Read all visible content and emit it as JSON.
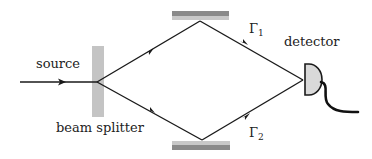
{
  "diagram": {
    "type": "Mach-Zehnder interferometer",
    "labels": {
      "source": "source",
      "beam_splitter": "beam splitter",
      "detector": "detector",
      "path1_symbol": "Γ",
      "path1_sub": "1",
      "path2_symbol": "Γ",
      "path2_sub": "2"
    },
    "colors": {
      "line": "#1a1a1a",
      "splitter": "#c4c4c4",
      "mirror_light": "#c8c8c8",
      "mirror_dark": "#8a8a8a",
      "detector_fill": "#d9d9d9"
    },
    "nodes": [
      {
        "id": "source",
        "label": "source"
      },
      {
        "id": "beam-splitter",
        "label": "beam splitter"
      },
      {
        "id": "mirror-top",
        "label": ""
      },
      {
        "id": "mirror-bottom",
        "label": ""
      },
      {
        "id": "detector",
        "label": "detector"
      }
    ],
    "edges": [
      {
        "from": "source",
        "to": "beam-splitter"
      },
      {
        "from": "beam-splitter",
        "to": "mirror-top"
      },
      {
        "from": "beam-splitter",
        "to": "mirror-bottom"
      },
      {
        "from": "mirror-top",
        "to": "detector",
        "label": "Γ1"
      },
      {
        "from": "mirror-bottom",
        "to": "detector",
        "label": "Γ2"
      }
    ]
  }
}
